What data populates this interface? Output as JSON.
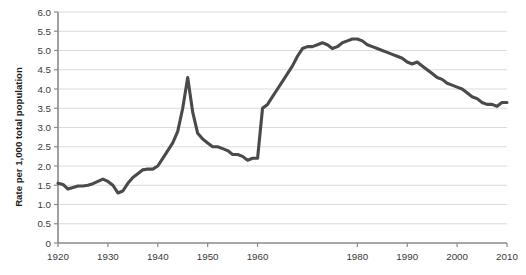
{
  "chart_data": {
    "type": "line",
    "title": "",
    "subtitle": "",
    "xlabel": "",
    "ylabel": "Rate per 1,000 total population",
    "xlim": [
      1920,
      2010
    ],
    "ylim": [
      0,
      6.0
    ],
    "grid": true,
    "legend": null,
    "legend_position": "none",
    "line_color": "#4a4a4a",
    "gridline_color": "#d2d2d2",
    "axis_color": "#8a8a8a",
    "background_color": "#ffffff",
    "ytick_labels": [
      "6.0",
      "5.5",
      "5.0",
      "4.5",
      "4.0",
      "3.5",
      "3.0",
      "2.5",
      "2.0",
      "1.5",
      "1.0",
      "0.5",
      "0"
    ],
    "ytick_values": [
      6.0,
      5.5,
      5.0,
      4.5,
      4.0,
      3.5,
      3.0,
      2.5,
      2.0,
      1.5,
      1.0,
      0.5,
      0
    ],
    "xtick_labels": [
      "1920",
      "1930",
      "1940",
      "1950",
      "1960",
      "1980",
      "1990",
      "2000",
      "2010"
    ],
    "xtick_values": [
      1920,
      1930,
      1940,
      1950,
      1960,
      1980,
      1990,
      2000,
      2010
    ],
    "x": [
      1920,
      1921,
      1922,
      1923,
      1924,
      1925,
      1926,
      1927,
      1928,
      1929,
      1930,
      1931,
      1932,
      1933,
      1934,
      1935,
      1936,
      1937,
      1938,
      1939,
      1940,
      1941,
      1942,
      1943,
      1944,
      1945,
      1946,
      1947,
      1948,
      1949,
      1950,
      1951,
      1952,
      1953,
      1954,
      1955,
      1956,
      1957,
      1958,
      1959,
      1960,
      1961,
      1962,
      1963,
      1964,
      1965,
      1966,
      1967,
      1968,
      1969,
      1970,
      1971,
      1972,
      1973,
      1974,
      1975,
      1976,
      1977,
      1978,
      1979,
      1980,
      1981,
      1982,
      1983,
      1984,
      1985,
      1986,
      1987,
      1988,
      1989,
      1990,
      1991,
      1992,
      1993,
      1994,
      1995,
      1996,
      1997,
      1998,
      1999,
      2000,
      2001,
      2002,
      2003,
      2004,
      2005,
      2006,
      2007,
      2008,
      2009,
      2010
    ],
    "values": [
      1.55,
      1.52,
      1.4,
      1.44,
      1.48,
      1.48,
      1.5,
      1.54,
      1.6,
      1.66,
      1.6,
      1.5,
      1.3,
      1.35,
      1.55,
      1.7,
      1.8,
      1.9,
      1.92,
      1.92,
      2.0,
      2.2,
      2.4,
      2.6,
      2.9,
      3.5,
      4.3,
      3.4,
      2.85,
      2.7,
      2.6,
      2.5,
      2.5,
      2.45,
      2.4,
      2.3,
      2.3,
      2.25,
      2.15,
      2.2,
      2.2,
      3.5,
      3.6,
      3.8,
      4.0,
      4.2,
      4.4,
      4.6,
      4.85,
      5.05,
      5.1,
      5.1,
      5.15,
      5.2,
      5.15,
      5.05,
      5.1,
      5.2,
      5.25,
      5.3,
      5.3,
      5.25,
      5.15,
      5.1,
      5.05,
      5.0,
      4.95,
      4.9,
      4.85,
      4.8,
      4.7,
      4.65,
      4.7,
      4.6,
      4.5,
      4.4,
      4.3,
      4.25,
      4.15,
      4.1,
      4.05,
      4.0,
      3.9,
      3.8,
      3.75,
      3.65,
      3.6,
      3.6,
      3.55,
      3.65,
      3.65
    ]
  },
  "axis": {
    "ylabel": "Rate per 1,000 total population"
  }
}
